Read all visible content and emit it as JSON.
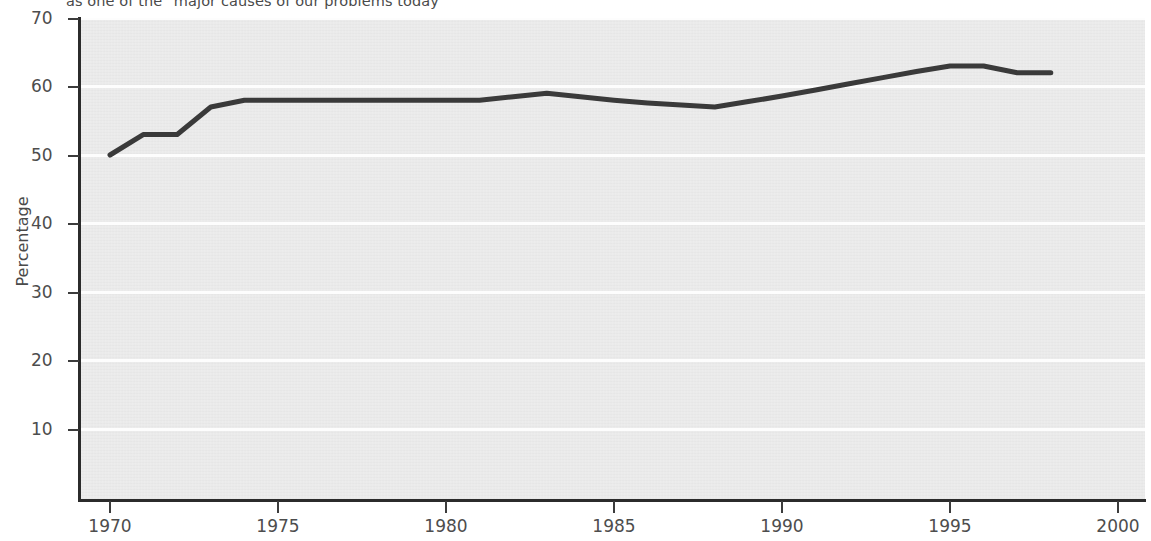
{
  "chart_data": {
    "type": "line",
    "title": "as one of the \"major causes of our problems today",
    "xlabel": "",
    "ylabel": "Percentage",
    "xlim": [
      1969,
      2000
    ],
    "ylim": [
      0,
      70
    ],
    "grid": true,
    "legend": "none",
    "x_ticks": [
      "1970",
      "1975",
      "1980",
      "1985",
      "1990",
      "1995",
      "2000"
    ],
    "x_tick_values": [
      1970,
      1975,
      1980,
      1985,
      1990,
      1995,
      2000
    ],
    "y_ticks": [
      "10",
      "20",
      "30",
      "40",
      "50",
      "60",
      "70"
    ],
    "y_tick_values": [
      10,
      20,
      30,
      40,
      50,
      60,
      70
    ],
    "series": [
      {
        "name": "Percentage",
        "color": "#3a3a3a",
        "x": [
          1970,
          1971,
          1972,
          1973,
          1974,
          1975,
          1976,
          1977,
          1978,
          1979,
          1980,
          1981,
          1982,
          1983,
          1984,
          1985,
          1986,
          1987,
          1988,
          1989,
          1990,
          1991,
          1992,
          1993,
          1994,
          1995,
          1996,
          1997,
          1998
        ],
        "values": [
          50,
          53,
          53,
          57,
          58,
          58,
          58,
          58,
          58,
          58,
          58,
          58,
          58.5,
          59,
          58.5,
          58,
          57.6,
          57.3,
          57,
          57.8,
          58.6,
          59.5,
          60.4,
          61.3,
          62.2,
          63,
          63,
          62,
          62
        ]
      }
    ]
  },
  "colors": {
    "plot_background": "#e9e9e9",
    "gridline": "#fdfdfd",
    "axis": "#2b2b2b",
    "series_line": "#3a3a3a",
    "text": "#4a4a4a"
  }
}
